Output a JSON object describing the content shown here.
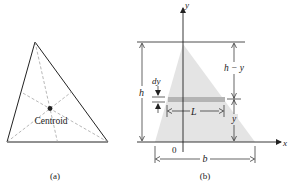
{
  "panel_a": {
    "centroid_label": "Centroid",
    "caption": "(a)"
  },
  "panel_b": {
    "y_axis_label": "y",
    "x_axis_label": "x",
    "origin_label": "0",
    "height_label": "h",
    "strip_thickness_label": "dy",
    "strip_length_label": "L",
    "upper_segment_label": "h − y",
    "lower_segment_label": "y",
    "base_label": "b",
    "caption": "(b)"
  },
  "colors": {
    "line": "#222222",
    "triangle_fill": "#e4e4e4",
    "strip_fill": "#b4b4b4",
    "median_dash": "#9a9a9a"
  }
}
